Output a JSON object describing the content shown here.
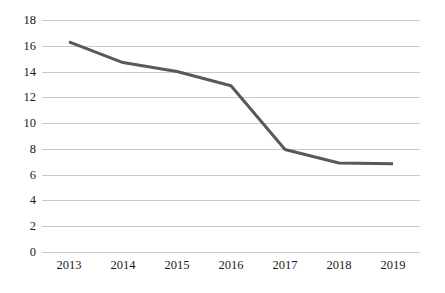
{
  "chart_data": {
    "type": "line",
    "title": "",
    "subtitle": "",
    "xlabel": "",
    "ylabel": "",
    "categories": [
      "2013",
      "2014",
      "2015",
      "2016",
      "2017",
      "2018",
      "2019"
    ],
    "values": [
      16.3,
      14.7,
      14.0,
      12.9,
      7.95,
      6.9,
      6.85
    ],
    "series": [
      {
        "name": "",
        "values": [
          16.3,
          14.7,
          14.0,
          12.9,
          7.95,
          6.9,
          6.85
        ],
        "color": "#595959",
        "marker": "none",
        "line_width": 3
      }
    ],
    "ylim": [
      0,
      18
    ],
    "y_tick_step": 2,
    "y_ticks": [
      0,
      2,
      4,
      6,
      8,
      10,
      12,
      14,
      16,
      18
    ],
    "y_tick_labels": [
      "0",
      "2",
      "4",
      "6",
      "8",
      "10",
      "12",
      "14",
      "16",
      "18"
    ],
    "x_ticks": [
      "2013",
      "2014",
      "2015",
      "2016",
      "2017",
      "2018",
      "2019"
    ],
    "grid": {
      "horizontal": true,
      "vertical": false,
      "color": "#c9c9c9"
    },
    "legend": {
      "visible": false,
      "position": "none",
      "entries": []
    },
    "axis_line": {
      "x_visible": false,
      "y_visible": false
    },
    "annotations": [],
    "background_color": "#ffffff",
    "text_color": "#1a1a1a"
  }
}
